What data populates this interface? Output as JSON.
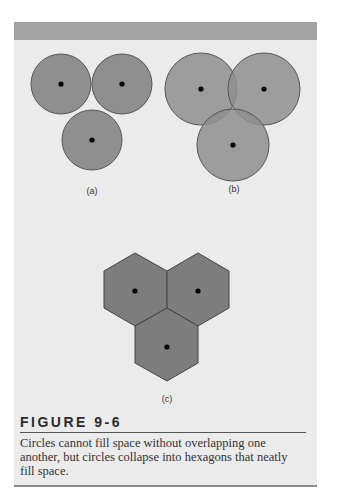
{
  "figure": {
    "label": "FIGURE 9-6",
    "caption": "Circles cannot fill space without overlapping one another, but circles collapse into hexagons that neatly fill space.",
    "panels": [
      {
        "id": "a",
        "label": "(a)",
        "description": "Three tangent circles leaving gaps"
      },
      {
        "id": "b",
        "label": "(b)",
        "description": "Three overlapping circles"
      },
      {
        "id": "c",
        "label": "(c)",
        "description": "Three hexagons tiling without gaps"
      }
    ]
  },
  "colors": {
    "page_background": "#ffffff",
    "panel_background": "#ebebeb",
    "top_bar": "#a3a3a3",
    "shape_fill": "#8f8f8f",
    "hexagon_fill": "#7d7d7d",
    "overlap_fill": "#767676",
    "outline": "#555555",
    "center_dot": "#000000"
  }
}
